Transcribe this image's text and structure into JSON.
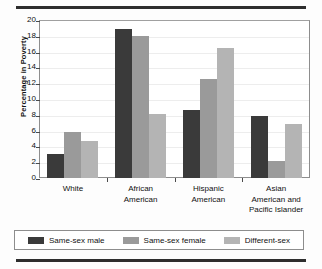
{
  "chart_data": {
    "type": "bar",
    "title": "",
    "subtitle": "",
    "xlabel": "",
    "ylabel": "Percentage in Poverty",
    "ylim": [
      0,
      20
    ],
    "ytick_step": 2,
    "yticks": [
      20,
      18,
      16,
      14,
      12,
      10,
      8,
      6,
      4,
      2,
      0
    ],
    "grid": true,
    "legend_position": "bottom",
    "categories": [
      "White",
      "African American",
      "Hispanic American",
      "Asian American and Pacific Islander"
    ],
    "category_lines": [
      [
        "White"
      ],
      [
        "African",
        "American"
      ],
      [
        "Hispanic",
        "American"
      ],
      [
        "Asian",
        "American and",
        "Pacific Islander"
      ]
    ],
    "series": [
      {
        "name": "Same-sex male",
        "color": "#3a3a3a",
        "values": [
          3.0,
          18.8,
          8.6,
          7.8
        ]
      },
      {
        "name": "Same-sex female",
        "color": "#9a9a9a",
        "values": [
          5.8,
          18.0,
          12.5,
          2.2
        ]
      },
      {
        "name": "Different-sex",
        "color": "#b4b4b4",
        "values": [
          4.7,
          8.1,
          16.4,
          6.9
        ]
      }
    ]
  },
  "legend": {
    "items": [
      {
        "label": "Same-sex male"
      },
      {
        "label": "Same-sex female"
      },
      {
        "label": "Different-sex"
      }
    ]
  },
  "colors": {
    "series_dark": "#3a3a3a",
    "series_medium": "#9a9a9a",
    "series_light": "#b4b4b4",
    "rule": "#2e2e2e",
    "frame": "#8d8d8d",
    "grid": "#ededed"
  }
}
